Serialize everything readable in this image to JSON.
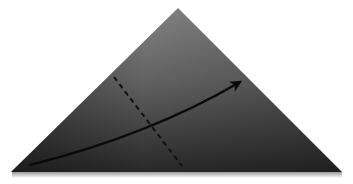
{
  "diagram": {
    "type": "origami-fold-step",
    "shape": {
      "kind": "triangle",
      "points": [
        [
          178,
          8
        ],
        [
          342,
          172
        ],
        [
          11,
          172
        ]
      ],
      "fill_top": "#7a7a7a",
      "fill_bottom": "#2e2e2e",
      "shadow_color": "#bdbdbd"
    },
    "fold_line": {
      "style": "dashed",
      "from": [
        114,
        77
      ],
      "to": [
        182,
        166
      ],
      "color": "#111111"
    },
    "arrow": {
      "style": "curved",
      "from": [
        30,
        165
      ],
      "control": [
        150,
        135
      ],
      "to": [
        240,
        82
      ],
      "color": "#0a0a0a"
    }
  }
}
